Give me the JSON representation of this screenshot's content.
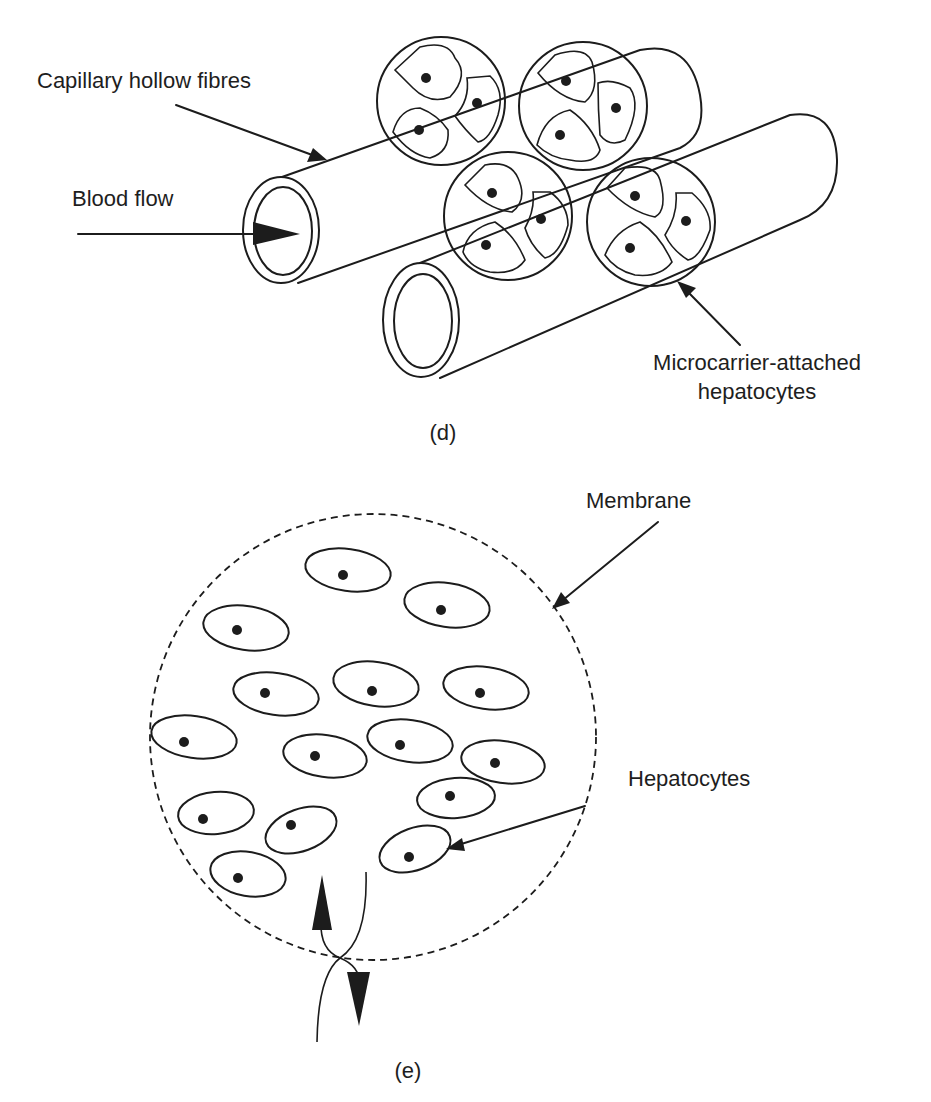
{
  "figure": {
    "panel_d": {
      "caption": "(d)",
      "labels": {
        "capillary": "Capillary hollow fibres",
        "blood_flow": "Blood flow",
        "microcarrier_line1": "Microcarrier-attached",
        "microcarrier_line2": "hepatocytes"
      },
      "components": {
        "hollow_fibre_count": 2,
        "microcarrier_count": 4,
        "hepatocytes_per_microcarrier": 3
      }
    },
    "panel_e": {
      "caption": "(e)",
      "labels": {
        "membrane": "Membrane",
        "hepatocytes": "Hepatocytes"
      },
      "components": {
        "hepatocyte_count": 16,
        "exchange_arrows": [
          "up",
          "down"
        ]
      }
    },
    "colors": {
      "background": "#ffffff",
      "ink": "#1c1c1c"
    }
  }
}
